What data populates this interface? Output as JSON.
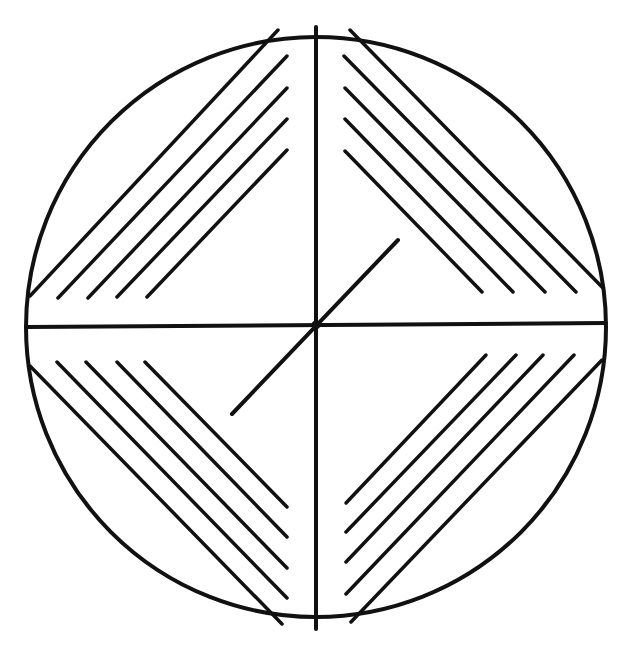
{
  "diagram": {
    "description": "Circle divided into four quadrants by vertical and horizontal axes, each quadrant containing five parallel diagonal hatch lines forming a diamond outline, with a short diagonal line through the center",
    "colors": {
      "stroke": "#111111",
      "background": "#ffffff"
    },
    "circle": {
      "cx": 316,
      "cy": 327,
      "r": 290
    },
    "axes": {
      "vertical": {
        "x1": 316,
        "y1": 27,
        "x2": 316,
        "y2": 629
      },
      "horizontal": {
        "x1": 27,
        "y1": 327,
        "x2": 606,
        "y2": 323
      }
    },
    "center_diagonal": {
      "x1": 232,
      "y1": 414,
      "x2": 398,
      "y2": 240
    },
    "quadrants": {
      "top_left": [
        [
          278,
          30,
          30,
          296
        ],
        [
          287,
          56,
          58,
          298
        ],
        [
          287,
          88,
          88,
          298
        ],
        [
          287,
          119,
          117,
          297
        ],
        [
          287,
          150,
          147,
          297
        ]
      ],
      "top_right": [
        [
          350,
          30,
          603,
          288
        ],
        [
          344,
          56,
          576,
          292
        ],
        [
          345,
          88,
          545,
          292
        ],
        [
          345,
          119,
          513,
          292
        ],
        [
          345,
          151,
          482,
          292
        ]
      ],
      "bottom_left": [
        [
          30,
          366,
          282,
          624
        ],
        [
          57,
          362,
          287,
          598
        ],
        [
          86,
          362,
          287,
          568
        ],
        [
          117,
          362,
          287,
          537
        ],
        [
          145,
          362,
          287,
          507
        ]
      ],
      "bottom_right": [
        [
          602,
          360,
          351,
          622
        ],
        [
          574,
          355,
          346,
          594
        ],
        [
          543,
          355,
          346,
          562
        ],
        [
          516,
          355,
          346,
          532
        ],
        [
          486,
          355,
          346,
          503
        ]
      ]
    }
  }
}
